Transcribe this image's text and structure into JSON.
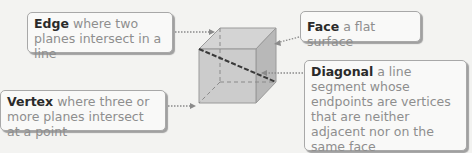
{
  "callouts": {
    "edge": {
      "term": "Edge",
      "definition": "where two planes intersect in a line"
    },
    "vertex": {
      "term": "Vertex",
      "definition": "where three or more planes intersect at a point"
    },
    "face": {
      "term": "Face",
      "definition": "a flat surface"
    },
    "diagonal": {
      "term": "Diagonal",
      "definition": "a line segment whose endpoints are vertices that are neither adjacent nor on the same face"
    }
  },
  "figure": {
    "shape": "cube",
    "colors": {
      "background": "#f3f3f1",
      "cube_front": "#c9c9c9",
      "cube_top": "#d6d6d6",
      "cube_side": "#b5b5b5",
      "diagonal_line": "#3a3a3a",
      "pointer": "#8a8a8a"
    }
  }
}
